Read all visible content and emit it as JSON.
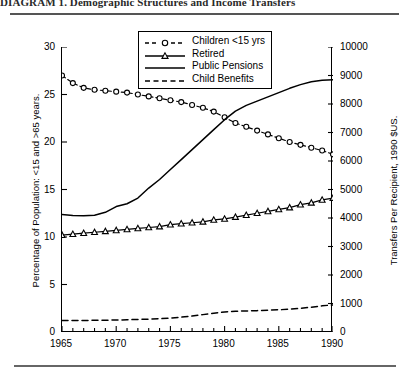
{
  "figure": {
    "title": "DIAGRAM 1. Demographic Structures and Income Transfers"
  },
  "legend": {
    "position": "top-center",
    "items": [
      {
        "label": "Children <15 yrs",
        "style": "dashed-with-open-circles"
      },
      {
        "label": "Retired",
        "style": "solid-with-open-triangles"
      },
      {
        "label": "Public Pensions",
        "style": "solid"
      },
      {
        "label": "Child Benefits",
        "style": "dashed"
      }
    ]
  },
  "chart_data": {
    "type": "line",
    "title": "",
    "xlabel": "",
    "ylabel": "Percentage of Population: <15 and >65 years.",
    "y2label": "Transfers Per Recipient, 1990 $US.",
    "xlim": [
      1965,
      1990
    ],
    "ylim": [
      0,
      30
    ],
    "y2lim": [
      0,
      10000
    ],
    "grid": false,
    "x_ticks": [
      1965,
      1970,
      1975,
      1980,
      1985,
      1990
    ],
    "x_tick_labels": [
      "1965",
      "1970",
      "1975",
      "1980",
      "1985",
      "1990"
    ],
    "x_minor_tick_step": 1,
    "y_ticks": [
      0,
      5,
      10,
      15,
      20,
      25,
      30
    ],
    "y_tick_labels": [
      "0",
      "5",
      "10",
      "15",
      "20",
      "25",
      "30"
    ],
    "y2_ticks": [
      0,
      1000,
      2000,
      3000,
      4000,
      5000,
      6000,
      7000,
      8000,
      9000,
      10000
    ],
    "y2_tick_labels": [
      "0",
      "1000",
      "2000",
      "3000",
      "4000",
      "5000",
      "6000",
      "7000",
      "8000",
      "9000",
      "10000"
    ],
    "x": [
      1965,
      1966,
      1967,
      1968,
      1969,
      1970,
      1971,
      1972,
      1973,
      1974,
      1975,
      1976,
      1977,
      1978,
      1979,
      1980,
      1981,
      1982,
      1983,
      1984,
      1985,
      1986,
      1987,
      1988,
      1989,
      1990
    ],
    "series": [
      {
        "name": "Children <15 yrs",
        "axis": "left",
        "marker": "open-circle",
        "line": "dashed",
        "values": [
          27.0,
          26.2,
          25.7,
          25.5,
          25.4,
          25.3,
          25.2,
          25.0,
          24.8,
          24.6,
          24.4,
          24.2,
          23.9,
          23.6,
          23.2,
          22.6,
          22.0,
          21.6,
          21.2,
          20.8,
          20.4,
          20.0,
          19.7,
          19.4,
          19.1,
          18.7
        ]
      },
      {
        "name": "Retired",
        "axis": "left",
        "marker": "open-triangle",
        "line": "solid",
        "values": [
          10.2,
          10.3,
          10.4,
          10.5,
          10.6,
          10.7,
          10.8,
          10.9,
          11.0,
          11.1,
          11.3,
          11.4,
          11.5,
          11.6,
          11.8,
          11.9,
          12.1,
          12.3,
          12.5,
          12.7,
          12.9,
          13.1,
          13.4,
          13.6,
          13.9,
          14.1
        ]
      },
      {
        "name": "Public Pensions",
        "axis": "right",
        "marker": "none",
        "line": "solid",
        "values": [
          4120,
          4090,
          4080,
          4100,
          4200,
          4400,
          4500,
          4700,
          5050,
          5350,
          5700,
          6050,
          6400,
          6750,
          7100,
          7450,
          7750,
          7950,
          8100,
          8250,
          8400,
          8550,
          8680,
          8780,
          8830,
          8850
        ]
      },
      {
        "name": "Child Benefits",
        "axis": "right",
        "marker": "none",
        "line": "dashed",
        "values": [
          400,
          400,
          405,
          410,
          415,
          420,
          430,
          440,
          450,
          465,
          490,
          520,
          560,
          610,
          660,
          700,
          730,
          740,
          750,
          765,
          780,
          800,
          830,
          870,
          920,
          950
        ]
      }
    ]
  }
}
